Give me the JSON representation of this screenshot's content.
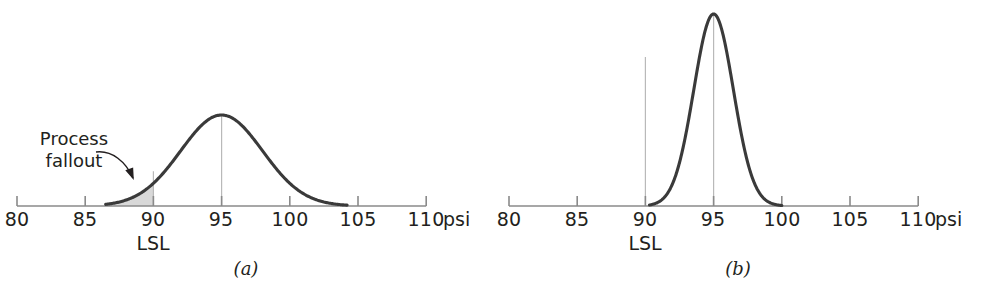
{
  "figure": {
    "background_color": "#ffffff",
    "curve_color": "#3a3a3a",
    "gridline_color": "#b9b9b9",
    "axis_color": "#8a8a8a",
    "text_color": "#231f20",
    "fallout_fill_color": "#d8d8d8"
  },
  "axis": {
    "unit_label": "psi",
    "tick_labels": [
      "80",
      "85",
      "90",
      "95",
      "100",
      "105",
      "110"
    ],
    "tick_values": [
      80,
      85,
      90,
      95,
      100,
      105,
      110
    ],
    "limit_label": "LSL",
    "limit_value": 90
  },
  "panels": [
    {
      "caption": "(a)",
      "annotation": "Process\nfallout",
      "has_fallout": true
    },
    {
      "caption": "(b)",
      "annotation": "",
      "has_fallout": false
    }
  ],
  "chart_data": {
    "type": "line",
    "title": "",
    "xlabel": "psi",
    "ylabel": "",
    "xlim": [
      80,
      110
    ],
    "grid": false,
    "legend": null,
    "annotations": [
      {
        "text": "Process fallout",
        "panel": "(a)",
        "points_to": "shaded tail left of LSL = 90"
      },
      {
        "text": "LSL",
        "panel": "(a)",
        "x": 90
      },
      {
        "text": "LSL",
        "panel": "(b)",
        "x": 90
      }
    ],
    "series": [
      {
        "name": "(a) wide process distribution",
        "panel": "(a)",
        "distribution": "normal",
        "mean": 95,
        "sigma": 3.0,
        "visible_range": [
          86.5,
          104.2
        ],
        "peak_x": 95,
        "lower_spec_limit": 90,
        "shaded_region": [
          86.5,
          90
        ],
        "shaded_label": "Process fallout"
      },
      {
        "name": "(b) narrow process distribution",
        "panel": "(b)",
        "distribution": "normal",
        "mean": 95,
        "sigma": 1.45,
        "visible_range": [
          90.3,
          100.0
        ],
        "peak_x": 95,
        "lower_spec_limit": 90,
        "shaded_region": null,
        "shaded_label": null
      }
    ],
    "vertical_lines": [
      {
        "panel": "(a)",
        "x": 90,
        "label": "LSL"
      },
      {
        "panel": "(a)",
        "x": 95,
        "label": "center"
      },
      {
        "panel": "(b)",
        "x": 90,
        "label": "LSL"
      },
      {
        "panel": "(b)",
        "x": 95,
        "label": "center"
      }
    ]
  }
}
